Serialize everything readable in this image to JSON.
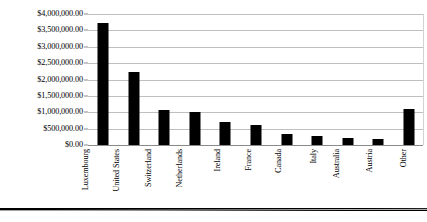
{
  "chart_data": {
    "type": "bar",
    "title": "",
    "xlabel": "",
    "ylabel": "",
    "categories": [
      "Luxembourg",
      "United States",
      "Switzerland",
      "Netherlands",
      "Ireland",
      "France",
      "Canada",
      "Italy",
      "Australia",
      "Austria",
      "Other"
    ],
    "values": [
      3720000,
      2230000,
      1060000,
      1000000,
      700000,
      620000,
      330000,
      290000,
      200000,
      180000,
      1100000
    ],
    "ylim": [
      0,
      4000000
    ],
    "ytick_values": [
      0,
      500000,
      1000000,
      1500000,
      2000000,
      2500000,
      3000000,
      3500000,
      4000000
    ],
    "ytick_labels": [
      "$0.00",
      "$500,000.00",
      "$1,000,000.00",
      "$1,500,000.00",
      "$2,000,000.00",
      "$2,500,000.00",
      "$3,000,000.00",
      "$3,500,000.00",
      "$4,000,000.00"
    ],
    "grid": true,
    "legend": false,
    "legend_position": "none",
    "bar_color": "#000000",
    "gridline_color": "#bfbfbf",
    "background_color": "#ffffff",
    "x_label_rotation": -90
  }
}
